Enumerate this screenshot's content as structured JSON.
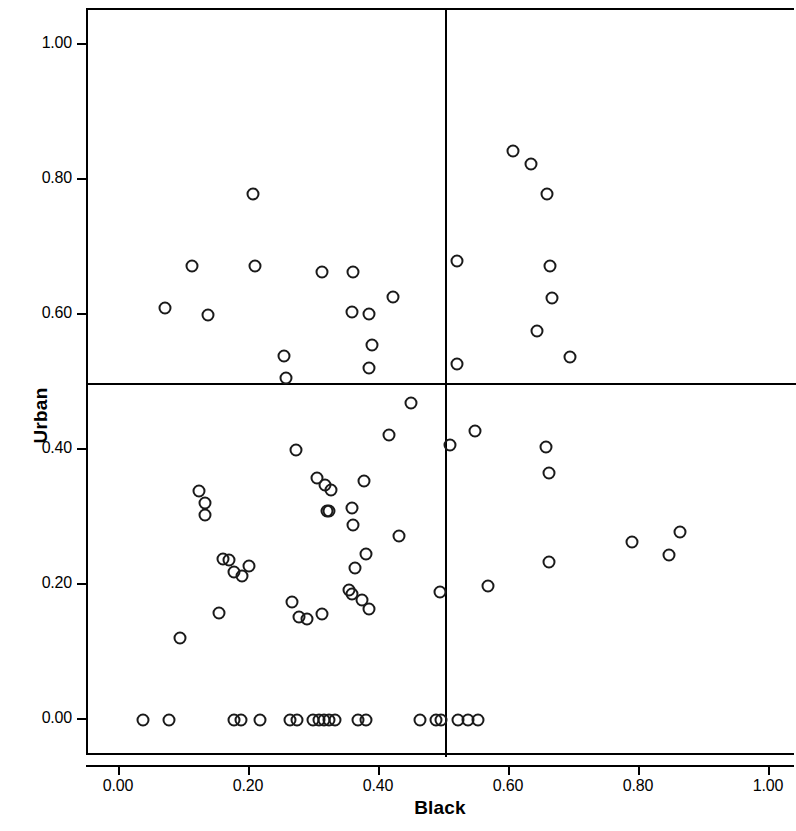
{
  "chart_data": {
    "type": "scatter",
    "title": "",
    "xlabel": "Black",
    "ylabel": "Urban",
    "xlim": [
      -0.045,
      1.09
    ],
    "ylim": [
      -0.05,
      1.065
    ],
    "xticks": [
      "0.00",
      "0.20",
      "0.40",
      "0.60",
      "0.80",
      "1.00"
    ],
    "xtick_values": [
      0.0,
      0.2,
      0.4,
      0.6,
      0.8,
      1.0
    ],
    "yticks": [
      "0.00",
      "0.20",
      "0.40",
      "0.60",
      "0.80",
      "1.00"
    ],
    "ytick_values": [
      0.0,
      0.2,
      0.4,
      0.6,
      0.8,
      1.0
    ],
    "grid": false,
    "legend": null,
    "reference_lines": {
      "vertical_x": 0.5,
      "horizontal_y": 0.5,
      "color": "#000000"
    },
    "marker": {
      "shape": "open-circle",
      "edge_color": "#1a1a1a",
      "fill": "none",
      "size_px": 13
    },
    "point_count": 96,
    "points": [
      [
        0.069,
        0.611
      ],
      [
        0.11,
        0.672
      ],
      [
        0.136,
        0.6
      ],
      [
        0.205,
        0.78
      ],
      [
        0.207,
        0.672
      ],
      [
        0.252,
        0.54
      ],
      [
        0.256,
        0.506
      ],
      [
        0.31,
        0.663
      ],
      [
        0.358,
        0.663
      ],
      [
        0.357,
        0.605
      ],
      [
        0.383,
        0.602
      ],
      [
        0.388,
        0.556
      ],
      [
        0.383,
        0.521
      ],
      [
        0.42,
        0.626
      ],
      [
        0.519,
        0.68
      ],
      [
        0.519,
        0.527
      ],
      [
        0.605,
        0.843
      ],
      [
        0.632,
        0.823
      ],
      [
        0.657,
        0.78
      ],
      [
        0.641,
        0.576
      ],
      [
        0.661,
        0.672
      ],
      [
        0.664,
        0.625
      ],
      [
        0.693,
        0.538
      ],
      [
        0.447,
        0.47
      ],
      [
        0.27,
        0.4
      ],
      [
        0.508,
        0.408
      ],
      [
        0.546,
        0.428
      ],
      [
        0.655,
        0.405
      ],
      [
        0.414,
        0.422
      ],
      [
        0.66,
        0.366
      ],
      [
        0.121,
        0.34
      ],
      [
        0.13,
        0.322
      ],
      [
        0.303,
        0.358
      ],
      [
        0.316,
        0.348
      ],
      [
        0.324,
        0.341
      ],
      [
        0.131,
        0.303
      ],
      [
        0.375,
        0.354
      ],
      [
        0.319,
        0.31
      ],
      [
        0.321,
        0.31
      ],
      [
        0.358,
        0.289
      ],
      [
        0.357,
        0.314
      ],
      [
        0.429,
        0.272
      ],
      [
        0.788,
        0.264
      ],
      [
        0.862,
        0.278
      ],
      [
        0.845,
        0.245
      ],
      [
        0.158,
        0.239
      ],
      [
        0.168,
        0.237
      ],
      [
        0.176,
        0.22
      ],
      [
        0.188,
        0.213
      ],
      [
        0.199,
        0.228
      ],
      [
        0.361,
        0.225
      ],
      [
        0.379,
        0.246
      ],
      [
        0.66,
        0.234
      ],
      [
        0.152,
        0.159
      ],
      [
        0.264,
        0.175
      ],
      [
        0.276,
        0.152
      ],
      [
        0.287,
        0.15
      ],
      [
        0.31,
        0.157
      ],
      [
        0.353,
        0.192
      ],
      [
        0.357,
        0.187
      ],
      [
        0.373,
        0.178
      ],
      [
        0.383,
        0.164
      ],
      [
        0.493,
        0.189
      ],
      [
        0.566,
        0.198
      ],
      [
        0.092,
        0.121
      ],
      [
        0.036,
        0.0
      ],
      [
        0.075,
        0.0
      ],
      [
        0.175,
        0.0
      ],
      [
        0.186,
        0.0
      ],
      [
        0.215,
        0.0
      ],
      [
        0.262,
        0.0
      ],
      [
        0.272,
        0.0
      ],
      [
        0.297,
        0.0
      ],
      [
        0.306,
        0.0
      ],
      [
        0.314,
        0.0
      ],
      [
        0.322,
        0.0
      ],
      [
        0.33,
        0.0
      ],
      [
        0.366,
        0.0
      ],
      [
        0.378,
        0.0
      ],
      [
        0.462,
        0.0
      ],
      [
        0.486,
        0.0
      ],
      [
        0.494,
        0.0
      ],
      [
        0.52,
        0.0
      ],
      [
        0.55,
        0.0
      ],
      [
        0.536,
        0.0
      ]
    ]
  },
  "axes": {
    "y_title": "Urban",
    "x_title": "Black"
  }
}
